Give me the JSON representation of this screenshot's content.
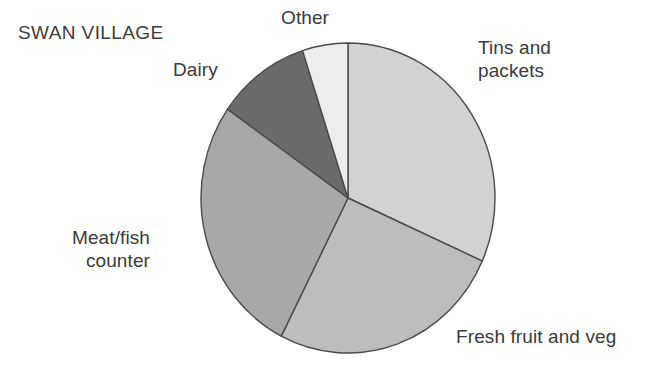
{
  "chart": {
    "title": "SWAN VILLAGE"
  },
  "labels": {
    "other": "Other",
    "tins": "Tins and\npackets",
    "fresh": "Fresh fruit and veg",
    "meat": "Meat/fish\ncounter",
    "dairy": "Dairy"
  },
  "chart_data": {
    "type": "pie",
    "title": "SWAN VILLAGE",
    "xlabel": "",
    "ylabel": "",
    "legend_position": "outside-labels",
    "grid": false,
    "start_angle_deg": 0,
    "direction": "clockwise",
    "center": {
      "x": 348,
      "y": 198
    },
    "radius": {
      "rx": 147,
      "ry": 155
    },
    "categories": [
      "Tins and packets",
      "Fresh fruit and veg",
      "Meat/fish counter",
      "Dairy",
      "Other"
    ],
    "values": [
      31.7,
      25.8,
      27.2,
      10.3,
      5.0
    ],
    "units": "percent",
    "slices": [
      {
        "label": "Tins and packets",
        "value": 31.7,
        "start_deg": 0,
        "end_deg": 114,
        "color": "#d2d2d2"
      },
      {
        "label": "Fresh fruit and veg",
        "value": 25.8,
        "start_deg": 114,
        "end_deg": 207,
        "color": "#bdbdbd"
      },
      {
        "label": "Meat/fish counter",
        "value": 27.2,
        "start_deg": 207,
        "end_deg": 305,
        "color": "#a8a8a8"
      },
      {
        "label": "Dairy",
        "value": 10.3,
        "start_deg": 305,
        "end_deg": 342,
        "color": "#6b6b6b"
      },
      {
        "label": "Other",
        "value": 5.0,
        "start_deg": 342,
        "end_deg": 360,
        "color": "#ededed"
      }
    ],
    "stroke_color": "#4a4a4a",
    "text_color": "#3a3a3a",
    "background": "#ffffff"
  }
}
